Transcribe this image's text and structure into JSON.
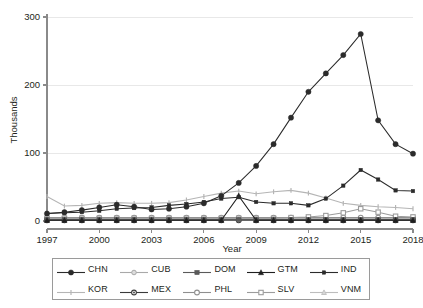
{
  "chart_data": {
    "type": "line",
    "title": "",
    "xlabel": "Year",
    "ylabel": "Thousands",
    "xlim": [
      1997,
      2018
    ],
    "ylim": [
      0,
      300
    ],
    "xticks": [
      1997,
      2000,
      2003,
      2006,
      2009,
      2012,
      2015,
      2018
    ],
    "yticks": [
      0,
      100,
      200,
      300
    ],
    "grid": "horizontal",
    "legend_position": "bottom",
    "x": [
      1997,
      1998,
      1999,
      2000,
      2001,
      2002,
      2003,
      2004,
      2005,
      2006,
      2007,
      2008,
      2009,
      2010,
      2011,
      2012,
      2013,
      2014,
      2015,
      2016,
      2017,
      2018
    ],
    "series": [
      {
        "name": "CHN",
        "marker": "filled-circle",
        "color": "#2b2b2b",
        "values": [
          11,
          13,
          16,
          20,
          24,
          21,
          17,
          18,
          21,
          26,
          37,
          56,
          81,
          113,
          152,
          190,
          217,
          244,
          275,
          148,
          113,
          99
        ]
      },
      {
        "name": "CUB",
        "marker": "light-diamond",
        "color": "#a9a9a9",
        "values": [
          3,
          3,
          3,
          3,
          3,
          3,
          3,
          3,
          3,
          3,
          3,
          3,
          3,
          3,
          3,
          3,
          3,
          3,
          3,
          3,
          3,
          3
        ]
      },
      {
        "name": "DOM",
        "marker": "filled-square",
        "color": "#5a5a5a",
        "values": [
          2,
          2,
          2,
          2,
          2,
          2,
          2,
          2,
          2,
          2,
          2,
          2,
          2,
          2,
          2,
          2,
          2,
          2,
          2,
          2,
          2,
          2
        ]
      },
      {
        "name": "GTM",
        "marker": "filled-triangle",
        "color": "#1f1f1f",
        "values": [
          1,
          1,
          1,
          1,
          1,
          1,
          1,
          1,
          1,
          1,
          1,
          37,
          1,
          1,
          1,
          1,
          1,
          1,
          1,
          1,
          1,
          1
        ]
      },
      {
        "name": "IND",
        "marker": "small-square",
        "color": "#2b2b2b",
        "values": [
          11,
          12,
          13,
          15,
          18,
          19,
          20,
          23,
          25,
          28,
          33,
          35,
          28,
          26,
          26,
          23,
          33,
          52,
          75,
          61,
          45,
          44
        ]
      },
      {
        "name": "KOR",
        "marker": "tick",
        "color": "#b5b5b5",
        "values": [
          36,
          22,
          23,
          26,
          27,
          26,
          26,
          27,
          31,
          36,
          41,
          44,
          40,
          43,
          45,
          41,
          34,
          26,
          23,
          21,
          20,
          18
        ]
      },
      {
        "name": "MEX",
        "marker": "dot-circle",
        "color": "#3a3a3a",
        "values": [
          1,
          1,
          1,
          1,
          1,
          1,
          1,
          1,
          1,
          1,
          1,
          1,
          1,
          1,
          1,
          1,
          1,
          1,
          1,
          1,
          1,
          1
        ]
      },
      {
        "name": "PHL",
        "marker": "open-circle",
        "color": "#8f8f8f",
        "values": [
          5,
          5,
          5,
          5,
          5,
          5,
          5,
          5,
          5,
          5,
          5,
          5,
          5,
          5,
          5,
          5,
          5,
          5,
          5,
          5,
          5,
          5
        ]
      },
      {
        "name": "SLV",
        "marker": "open-square",
        "color": "#9c9c9c",
        "values": [
          4,
          4,
          4,
          4,
          4,
          4,
          4,
          4,
          4,
          4,
          4,
          4,
          4,
          4,
          5,
          6,
          8,
          12,
          18,
          13,
          7,
          6
        ]
      },
      {
        "name": "VNM",
        "marker": "light-triangle",
        "color": "#bdbdbd",
        "values": [
          4,
          4,
          4,
          4,
          4,
          4,
          4,
          4,
          4,
          4,
          4,
          4,
          4,
          4,
          4,
          4,
          4,
          4,
          4,
          4,
          4,
          4
        ]
      }
    ]
  },
  "legend": {
    "entries": [
      {
        "label": "CHN"
      },
      {
        "label": "CUB"
      },
      {
        "label": "DOM"
      },
      {
        "label": "GTM"
      },
      {
        "label": "IND"
      },
      {
        "label": "KOR"
      },
      {
        "label": "MEX"
      },
      {
        "label": "PHL"
      },
      {
        "label": "SLV"
      },
      {
        "label": "VNM"
      }
    ]
  }
}
